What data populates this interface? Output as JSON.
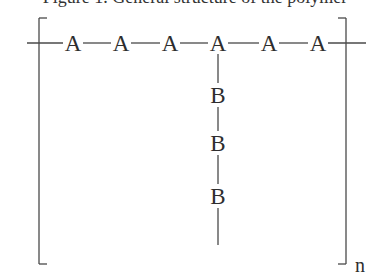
{
  "caption_partial": "Figure 1. General structure of the polymer",
  "diagram": {
    "type": "polymer-repeat-unit",
    "backbone": {
      "label": "A",
      "count": 6,
      "units": [
        "A",
        "A",
        "A",
        "A",
        "A",
        "A"
      ],
      "x": [
        73,
        121,
        170,
        218,
        269,
        318
      ],
      "y": 43
    },
    "side_chain": {
      "label": "B",
      "count": 3,
      "units": [
        "B",
        "B",
        "B"
      ],
      "attached_to_backbone_index": 3,
      "x": 218,
      "y": [
        95,
        143,
        196
      ],
      "line_end_y": 245
    },
    "bracket": {
      "left_x": 39,
      "right_x": 346,
      "top_y": 18,
      "bottom_y": 264,
      "hook": 8
    },
    "subscript": "n",
    "colors": {
      "line": "#4a4a4a",
      "text": "#2e2e2e",
      "background": "#ffffff"
    }
  }
}
